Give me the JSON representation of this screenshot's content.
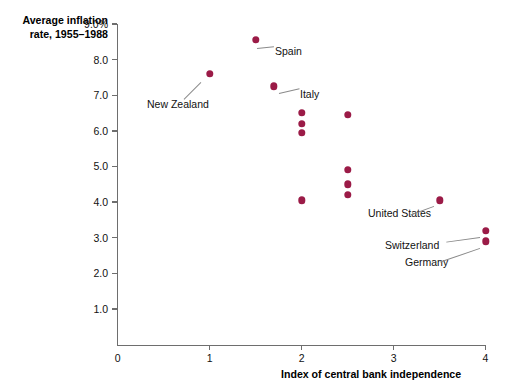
{
  "chart_data": {
    "type": "scatter",
    "title": "",
    "xlabel": "Index of central bank independence",
    "ylabel": "Average inflation rate, 1955–1988",
    "ylabel_lines": [
      "Average inflation",
      "rate, 1955–1988"
    ],
    "xlim": [
      0,
      4
    ],
    "ylim": [
      0,
      9.0
    ],
    "grid": false,
    "legend": null,
    "marker_color": "#9B1B47",
    "axis_color": "#6E6E6E",
    "x_ticks": [
      "0",
      "1",
      "2",
      "3",
      "4"
    ],
    "x_tick_values": [
      0,
      1,
      2,
      3,
      4
    ],
    "y_ticks": [
      "1.0",
      "2.0",
      "3.0",
      "4.0",
      "5.0",
      "6.0",
      "7.0",
      "8.0",
      "9.0%"
    ],
    "y_tick_values": [
      1.0,
      2.0,
      3.0,
      4.0,
      5.0,
      6.0,
      7.0,
      8.0,
      9.0
    ],
    "points": [
      {
        "x": 1.0,
        "y": 7.6,
        "label": "New Zealand"
      },
      {
        "x": 1.5,
        "y": 8.55,
        "label": "Spain"
      },
      {
        "x": 1.7,
        "y": 7.25,
        "label": "Italy"
      },
      {
        "x": 2.0,
        "y": 6.5,
        "label": ""
      },
      {
        "x": 2.0,
        "y": 6.2,
        "label": ""
      },
      {
        "x": 2.0,
        "y": 5.95,
        "label": ""
      },
      {
        "x": 2.0,
        "y": 4.05,
        "label": ""
      },
      {
        "x": 2.5,
        "y": 6.45,
        "label": ""
      },
      {
        "x": 2.5,
        "y": 4.9,
        "label": ""
      },
      {
        "x": 2.5,
        "y": 4.5,
        "label": ""
      },
      {
        "x": 2.5,
        "y": 4.2,
        "label": ""
      },
      {
        "x": 3.5,
        "y": 4.05,
        "label": "United States"
      },
      {
        "x": 4.0,
        "y": 3.2,
        "label": "Switzerland"
      },
      {
        "x": 4.0,
        "y": 2.9,
        "label": "Germany"
      }
    ],
    "annotations": [
      {
        "text": "Spain",
        "tx": 275,
        "ty": 45,
        "lx": 257,
        "ly": 48,
        "len": 17,
        "ang": -6
      },
      {
        "text": "New Zealand",
        "tx": 147,
        "ty": 98,
        "lx": 201,
        "ly": 82,
        "len": 24,
        "ang": 135
      },
      {
        "text": "Italy",
        "tx": 300,
        "ty": 88,
        "lx": 279,
        "ly": 93,
        "len": 21,
        "ang": -13
      },
      {
        "text": "United States",
        "tx": 368,
        "ty": 207,
        "lx": 434,
        "ly": 206,
        "len": 25,
        "ang": 160
      },
      {
        "text": "Switzerland",
        "tx": 385,
        "ty": 239,
        "lx": 480,
        "ly": 237,
        "len": 34,
        "ang": 172
      },
      {
        "text": "Germany",
        "tx": 405,
        "ty": 256,
        "lx": 480,
        "ly": 248,
        "len": 42,
        "ang": 161
      }
    ]
  }
}
